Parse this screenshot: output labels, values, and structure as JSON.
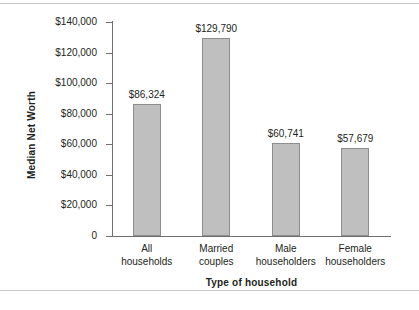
{
  "chart_data": {
    "type": "bar",
    "title": "",
    "xlabel": "Type of household",
    "ylabel": "Median Net Worth",
    "categories": [
      "All households",
      "Married couples",
      "Male householders",
      "Female householders"
    ],
    "category_lines": [
      [
        "All",
        "households"
      ],
      [
        "Married",
        "couples"
      ],
      [
        "Male",
        "householders"
      ],
      [
        "Female",
        "householders"
      ]
    ],
    "values": [
      86324,
      129790,
      60741,
      57679
    ],
    "value_labels": [
      "$86,324",
      "$129,790",
      "$60,741",
      "$57,679"
    ],
    "ylim": [
      0,
      140000
    ],
    "yticks": [
      0,
      20000,
      40000,
      60000,
      80000,
      100000,
      120000,
      140000
    ],
    "ytick_labels": [
      "0",
      "$20,000",
      "$40,000",
      "$60,000",
      "$80,000",
      "$100,000",
      "$120,000",
      "$140,000"
    ],
    "grid": false,
    "legend": false,
    "bar_color": "#bfbfbf",
    "bar_border_color": "#8d8d8d",
    "axis_color": "#6f6f6f",
    "text_color": "#231f20",
    "background_color": "#ffffff"
  }
}
